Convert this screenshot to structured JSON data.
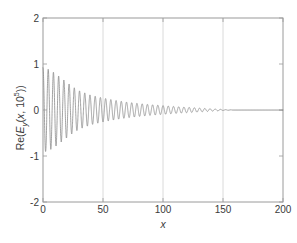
{
  "chart_data": {
    "type": "line",
    "title": "",
    "xlabel": "x",
    "ylabel": "Re(Ey(x, 10^5))",
    "ylabel_parts": {
      "prefix": "Re(",
      "field": "E",
      "subscript": "y",
      "open": "(",
      "var": "x",
      "comma": ", 10",
      "exponent": "5",
      "close": "))"
    },
    "xlim": [
      0,
      200
    ],
    "ylim": [
      -2,
      2
    ],
    "xticks": [
      0,
      50,
      100,
      150,
      200
    ],
    "xtick_labels": [
      "0",
      "50",
      "100",
      "150",
      "200"
    ],
    "yticks": [
      -2,
      -1,
      0,
      1,
      2
    ],
    "ytick_labels": [
      "-2",
      "-1",
      "0",
      "1",
      "2"
    ],
    "grid": {
      "vertical": true,
      "horizontal": false,
      "vertical_at": [
        50,
        100,
        150
      ]
    },
    "legend": null,
    "line_color": "#8a8a8a",
    "axes_color": "#9a9a9a",
    "grid_color": "#d0d0d0",
    "background": "#ffffff",
    "series": [
      {
        "name": "Re(Ey)",
        "envelope_amplitude_at": [
          {
            "x": 0,
            "a": 0.92
          },
          {
            "x": 5,
            "a": 0.88
          },
          {
            "x": 10,
            "a": 0.8
          },
          {
            "x": 15,
            "a": 0.7
          },
          {
            "x": 20,
            "a": 0.6
          },
          {
            "x": 25,
            "a": 0.5
          },
          {
            "x": 30,
            "a": 0.42
          },
          {
            "x": 40,
            "a": 0.32
          },
          {
            "x": 50,
            "a": 0.26
          },
          {
            "x": 60,
            "a": 0.21
          },
          {
            "x": 70,
            "a": 0.17
          },
          {
            "x": 80,
            "a": 0.14
          },
          {
            "x": 90,
            "a": 0.115
          },
          {
            "x": 100,
            "a": 0.095
          },
          {
            "x": 110,
            "a": 0.075
          },
          {
            "x": 120,
            "a": 0.058
          },
          {
            "x": 130,
            "a": 0.042
          },
          {
            "x": 140,
            "a": 0.026
          },
          {
            "x": 150,
            "a": 0.01
          },
          {
            "x": 160,
            "a": 0.0
          },
          {
            "x": 200,
            "a": 0.0
          }
        ],
        "period": 4.35,
        "phase_deg": 0
      }
    ]
  },
  "axes": {
    "xlabel": "x",
    "ytick_labels": [
      "2",
      "1",
      "0",
      "-1",
      "-2"
    ],
    "xtick_labels": [
      "0",
      "50",
      "100",
      "150",
      "200"
    ]
  }
}
